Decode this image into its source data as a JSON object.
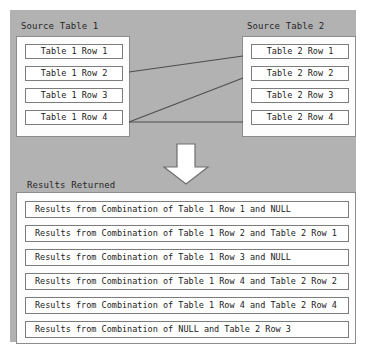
{
  "diagram": {
    "title_source_1": "Source Table 1",
    "title_source_2": "Source Table 2",
    "title_results": "Results Returned",
    "arrow_icon": "down-arrow-icon",
    "colors": {
      "background_field": "#b2b2b2",
      "panel_fill": "#fdfdfd",
      "box_fill": "#ffffff",
      "box_border": "#7d7d7d",
      "panel_border": "#8c8c8c",
      "connector_line": "#4d4d4d",
      "text": "#1a1a1a",
      "arrow_fill": "#ffffff",
      "arrow_border": "#6e6e6e"
    }
  },
  "source_table_1": {
    "rows": [
      "Table 1 Row 1",
      "Table 1 Row 2",
      "Table 1 Row 3",
      "Table 1 Row 4"
    ]
  },
  "source_table_2": {
    "rows": [
      "Table 2 Row 1",
      "Table 2 Row 2",
      "Table 2 Row 3",
      "Table 2 Row 4"
    ]
  },
  "results": {
    "rows": [
      "Results from Combination of Table 1 Row 1 and NULL",
      "Results from Combination of Table 1 Row 2 and Table 2 Row 1",
      "Results from Combination of Table 1 Row 3 and NULL",
      "Results from Combination of Table 1 Row 4 and Table 2 Row 2",
      "Results from Combination of Table 1 Row 4 and Table 2 Row 4",
      "Results from Combination of NULL and Table 2 Row 3"
    ]
  },
  "connections": [
    {
      "from": "Table 1 Row 2",
      "to": "Table 2 Row 1"
    },
    {
      "from": "Table 1 Row 4",
      "to": "Table 2 Row 2"
    },
    {
      "from": "Table 1 Row 4",
      "to": "Table 2 Row 4"
    }
  ]
}
